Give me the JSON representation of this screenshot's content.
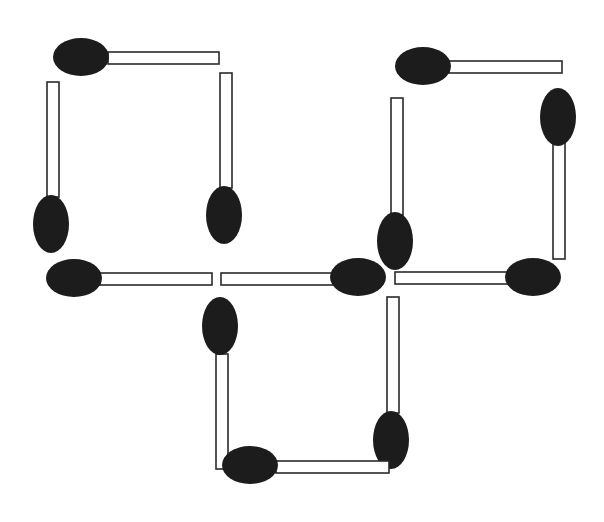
{
  "diagram": {
    "type": "matchstick-puzzle",
    "width": 604,
    "height": 522,
    "background": "#ffffff",
    "colors": {
      "head": "#1c1c1c",
      "stick_fill": "#ffffff",
      "stick_stroke": "#2a2a2a"
    },
    "shapes": [
      {
        "name": "top-left-square",
        "match_ids": [
          1,
          2,
          3,
          4
        ]
      },
      {
        "name": "top-right-square",
        "match_ids": [
          6,
          7,
          8,
          9
        ]
      },
      {
        "name": "bottom-square",
        "match_ids": [
          5,
          10,
          11,
          12
        ]
      }
    ],
    "match_count": 12,
    "matches": [
      {
        "id": 1,
        "orientation": "horizontal",
        "head_side": "left",
        "stick": {
          "x": 108,
          "y": 52,
          "w": 111,
          "h": 12
        },
        "head": {
          "cx": 81,
          "cy": 57,
          "rx": 28,
          "ry": 19
        }
      },
      {
        "id": 2,
        "orientation": "vertical",
        "head_side": "bottom",
        "stick": {
          "x": 47,
          "y": 82,
          "w": 12,
          "h": 115
        },
        "head": {
          "cx": 51,
          "cy": 224,
          "rx": 18,
          "ry": 29
        }
      },
      {
        "id": 3,
        "orientation": "vertical",
        "head_side": "bottom",
        "stick": {
          "x": 220,
          "y": 73,
          "w": 12,
          "h": 115
        },
        "head": {
          "cx": 224,
          "cy": 215,
          "rx": 18,
          "ry": 29
        }
      },
      {
        "id": 4,
        "orientation": "horizontal",
        "head_side": "left",
        "stick": {
          "x": 100,
          "y": 273,
          "w": 112,
          "h": 12
        },
        "head": {
          "cx": 74,
          "cy": 278,
          "rx": 28,
          "ry": 19
        }
      },
      {
        "id": 5,
        "orientation": "horizontal",
        "head_side": "right",
        "stick": {
          "x": 221,
          "y": 273,
          "w": 113,
          "h": 12
        },
        "head": {
          "cx": 358,
          "cy": 277,
          "rx": 28,
          "ry": 19
        }
      },
      {
        "id": 6,
        "orientation": "horizontal",
        "head_side": "left",
        "stick": {
          "x": 449,
          "y": 61,
          "w": 113,
          "h": 12
        },
        "head": {
          "cx": 423,
          "cy": 66,
          "rx": 28,
          "ry": 19
        }
      },
      {
        "id": 7,
        "orientation": "vertical",
        "head_side": "bottom",
        "stick": {
          "x": 391,
          "y": 98,
          "w": 12,
          "h": 117
        },
        "head": {
          "cx": 395,
          "cy": 241,
          "rx": 18,
          "ry": 29
        }
      },
      {
        "id": 8,
        "orientation": "vertical",
        "head_side": "top",
        "stick": {
          "x": 553,
          "y": 143,
          "w": 12,
          "h": 116
        },
        "head": {
          "cx": 558,
          "cy": 117,
          "rx": 18,
          "ry": 29
        }
      },
      {
        "id": 9,
        "orientation": "horizontal",
        "head_side": "right",
        "stick": {
          "x": 395,
          "y": 272,
          "w": 113,
          "h": 12
        },
        "head": {
          "cx": 533,
          "cy": 277,
          "rx": 28,
          "ry": 19
        }
      },
      {
        "id": 10,
        "orientation": "vertical",
        "head_side": "top",
        "stick": {
          "x": 216,
          "y": 354,
          "w": 12,
          "h": 115
        },
        "head": {
          "cx": 220,
          "cy": 326,
          "rx": 18,
          "ry": 29
        }
      },
      {
        "id": 11,
        "orientation": "vertical",
        "head_side": "bottom",
        "stick": {
          "x": 387,
          "y": 297,
          "w": 12,
          "h": 116
        },
        "head": {
          "cx": 391,
          "cy": 440,
          "rx": 18,
          "ry": 29
        }
      },
      {
        "id": 12,
        "orientation": "horizontal",
        "head_side": "left",
        "stick": {
          "x": 276,
          "y": 461,
          "w": 113,
          "h": 12
        },
        "head": {
          "cx": 250,
          "cy": 465,
          "rx": 28,
          "ry": 19
        }
      }
    ]
  }
}
